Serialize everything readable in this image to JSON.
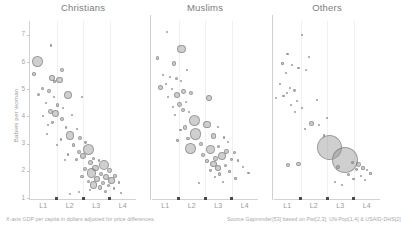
{
  "chart_data": {
    "type": "scatter",
    "title": "",
    "xlabel": "X-axis GDP per capita in dollars adjusted for price differences.",
    "ylabel": "Babies per woman",
    "ylim": [
      1,
      7.4
    ],
    "yticks": [
      1,
      2,
      3,
      4,
      5,
      6,
      7
    ],
    "xticks_labels": [
      "L1",
      "L2",
      "L3",
      "L4"
    ],
    "grid": "faint-vertical",
    "legend": "none",
    "source": "Source Gapminder[53] based on Pwt[2,3], UN-Pop[1,4] & USAID-DHS[2]",
    "panels": [
      {
        "name": "Christians",
        "points": [
          {
            "x": 0.07,
            "y": 6.03,
            "r": 5.4
          },
          {
            "x": 0.2,
            "y": 6.6,
            "r": 1.3
          },
          {
            "x": 0.04,
            "y": 5.55,
            "r": 1.8
          },
          {
            "x": 0.3,
            "y": 5.7,
            "r": 2.2
          },
          {
            "x": 0.21,
            "y": 5.42,
            "r": 2.8
          },
          {
            "x": 0.23,
            "y": 5.28,
            "r": 1.2
          },
          {
            "x": 0.28,
            "y": 5.35,
            "r": 3.2
          },
          {
            "x": 0.12,
            "y": 5.02,
            "r": 1.6
          },
          {
            "x": 0.18,
            "y": 4.92,
            "r": 2.0
          },
          {
            "x": 0.08,
            "y": 4.8,
            "r": 1.5
          },
          {
            "x": 0.23,
            "y": 4.72,
            "r": 1.1
          },
          {
            "x": 0.36,
            "y": 4.8,
            "r": 4.0
          },
          {
            "x": 0.49,
            "y": 4.72,
            "r": 1.0
          },
          {
            "x": 0.15,
            "y": 4.5,
            "r": 1.3
          },
          {
            "x": 0.26,
            "y": 4.42,
            "r": 1.6
          },
          {
            "x": 0.31,
            "y": 4.3,
            "r": 1.2
          },
          {
            "x": 0.19,
            "y": 4.18,
            "r": 2.4
          },
          {
            "x": 0.24,
            "y": 4.1,
            "r": 3.6
          },
          {
            "x": 0.12,
            "y": 4.02,
            "r": 1.1
          },
          {
            "x": 0.4,
            "y": 4.05,
            "r": 1.0
          },
          {
            "x": 0.3,
            "y": 3.9,
            "r": 2.2
          },
          {
            "x": 0.21,
            "y": 3.78,
            "r": 1.4
          },
          {
            "x": 0.17,
            "y": 3.7,
            "r": 1.0
          },
          {
            "x": 0.34,
            "y": 3.6,
            "r": 1.2
          },
          {
            "x": 0.44,
            "y": 3.55,
            "r": 1.1
          },
          {
            "x": 0.38,
            "y": 3.3,
            "r": 4.2
          },
          {
            "x": 0.47,
            "y": 3.22,
            "r": 2.0
          },
          {
            "x": 0.29,
            "y": 3.15,
            "r": 1.2
          },
          {
            "x": 0.52,
            "y": 3.05,
            "r": 1.4
          },
          {
            "x": 0.41,
            "y": 2.95,
            "r": 1.6
          },
          {
            "x": 0.46,
            "y": 2.7,
            "r": 2.2
          },
          {
            "x": 0.55,
            "y": 2.78,
            "r": 5.6
          },
          {
            "x": 0.5,
            "y": 2.55,
            "r": 3.0
          },
          {
            "x": 0.36,
            "y": 2.6,
            "r": 1.3
          },
          {
            "x": 0.6,
            "y": 2.45,
            "r": 1.8
          },
          {
            "x": 0.44,
            "y": 2.42,
            "r": 1.5
          },
          {
            "x": 0.57,
            "y": 2.32,
            "r": 2.6
          },
          {
            "x": 0.65,
            "y": 2.38,
            "r": 1.4
          },
          {
            "x": 0.7,
            "y": 2.22,
            "r": 5.2
          },
          {
            "x": 0.62,
            "y": 2.1,
            "r": 3.4
          },
          {
            "x": 0.52,
            "y": 2.05,
            "r": 2.0
          },
          {
            "x": 0.75,
            "y": 2.0,
            "r": 2.4
          },
          {
            "x": 0.58,
            "y": 1.92,
            "r": 4.6
          },
          {
            "x": 0.67,
            "y": 1.88,
            "r": 2.2
          },
          {
            "x": 0.49,
            "y": 1.8,
            "r": 1.6
          },
          {
            "x": 0.72,
            "y": 1.78,
            "r": 3.0
          },
          {
            "x": 0.8,
            "y": 1.82,
            "r": 1.8
          },
          {
            "x": 0.63,
            "y": 1.7,
            "r": 2.8
          },
          {
            "x": 0.77,
            "y": 1.65,
            "r": 3.2
          },
          {
            "x": 0.55,
            "y": 1.62,
            "r": 1.5
          },
          {
            "x": 0.69,
            "y": 1.55,
            "r": 2.0
          },
          {
            "x": 0.84,
            "y": 1.58,
            "r": 1.4
          },
          {
            "x": 0.6,
            "y": 1.48,
            "r": 3.6
          },
          {
            "x": 0.74,
            "y": 1.45,
            "r": 1.7
          },
          {
            "x": 0.66,
            "y": 1.38,
            "r": 2.4
          },
          {
            "x": 0.79,
            "y": 1.35,
            "r": 1.2
          },
          {
            "x": 0.57,
            "y": 1.3,
            "r": 1.0
          },
          {
            "x": 0.71,
            "y": 1.25,
            "r": 1.5
          },
          {
            "x": 0.46,
            "y": 1.22,
            "r": 0.9
          },
          {
            "x": 0.38,
            "y": 1.15,
            "r": 0.8
          },
          {
            "x": 0.86,
            "y": 1.2,
            "r": 1.0
          },
          {
            "x": 0.25,
            "y": 2.95,
            "r": 0.9
          },
          {
            "x": 0.33,
            "y": 2.4,
            "r": 0.9
          },
          {
            "x": 0.16,
            "y": 3.35,
            "r": 0.9
          }
        ]
      },
      {
        "name": "Muslims",
        "points": [
          {
            "x": 0.14,
            "y": 7.1,
            "r": 1.2
          },
          {
            "x": 0.28,
            "y": 6.48,
            "r": 4.4
          },
          {
            "x": 0.05,
            "y": 6.15,
            "r": 1.6
          },
          {
            "x": 0.21,
            "y": 5.95,
            "r": 2.2
          },
          {
            "x": 0.33,
            "y": 5.7,
            "r": 1.0
          },
          {
            "x": 0.1,
            "y": 5.52,
            "r": 1.1
          },
          {
            "x": 0.17,
            "y": 5.45,
            "r": 1.4
          },
          {
            "x": 0.23,
            "y": 5.4,
            "r": 1.5
          },
          {
            "x": 0.27,
            "y": 5.3,
            "r": 1.0
          },
          {
            "x": 0.13,
            "y": 5.2,
            "r": 1.0
          },
          {
            "x": 0.08,
            "y": 5.05,
            "r": 2.6
          },
          {
            "x": 0.19,
            "y": 5.0,
            "r": 1.2
          },
          {
            "x": 0.3,
            "y": 4.92,
            "r": 2.4
          },
          {
            "x": 0.37,
            "y": 4.88,
            "r": 2.0
          },
          {
            "x": 0.24,
            "y": 4.78,
            "r": 3.0
          },
          {
            "x": 0.15,
            "y": 4.7,
            "r": 1.1
          },
          {
            "x": 0.54,
            "y": 4.68,
            "r": 3.0
          },
          {
            "x": 0.32,
            "y": 4.52,
            "r": 1.0
          },
          {
            "x": 0.26,
            "y": 4.45,
            "r": 2.4
          },
          {
            "x": 0.2,
            "y": 4.35,
            "r": 1.2
          },
          {
            "x": 0.29,
            "y": 4.25,
            "r": 2.0
          },
          {
            "x": 0.35,
            "y": 4.15,
            "r": 1.0
          },
          {
            "x": 0.22,
            "y": 4.05,
            "r": 1.1
          },
          {
            "x": 0.4,
            "y": 3.85,
            "r": 5.6
          },
          {
            "x": 0.52,
            "y": 3.7,
            "r": 3.8
          },
          {
            "x": 0.31,
            "y": 3.6,
            "r": 2.2
          },
          {
            "x": 0.62,
            "y": 3.62,
            "r": 1.2
          },
          {
            "x": 0.27,
            "y": 3.5,
            "r": 1.4
          },
          {
            "x": 0.41,
            "y": 3.35,
            "r": 5.8
          },
          {
            "x": 0.58,
            "y": 3.28,
            "r": 2.6
          },
          {
            "x": 0.68,
            "y": 3.22,
            "r": 1.4
          },
          {
            "x": 0.34,
            "y": 3.2,
            "r": 1.6
          },
          {
            "x": 0.24,
            "y": 3.12,
            "r": 1.2
          },
          {
            "x": 0.72,
            "y": 3.05,
            "r": 1.0
          },
          {
            "x": 0.46,
            "y": 2.98,
            "r": 2.0
          },
          {
            "x": 0.63,
            "y": 2.9,
            "r": 1.5
          },
          {
            "x": 0.36,
            "y": 2.82,
            "r": 5.4
          },
          {
            "x": 0.55,
            "y": 2.78,
            "r": 4.6
          },
          {
            "x": 0.7,
            "y": 2.72,
            "r": 2.4
          },
          {
            "x": 0.78,
            "y": 2.68,
            "r": 1.6
          },
          {
            "x": 0.48,
            "y": 2.6,
            "r": 2.0
          },
          {
            "x": 0.66,
            "y": 2.55,
            "r": 4.2
          },
          {
            "x": 0.6,
            "y": 2.45,
            "r": 2.2
          },
          {
            "x": 0.75,
            "y": 2.42,
            "r": 1.4
          },
          {
            "x": 0.52,
            "y": 2.35,
            "r": 1.8
          },
          {
            "x": 0.81,
            "y": 2.38,
            "r": 1.2
          },
          {
            "x": 0.58,
            "y": 2.25,
            "r": 3.4
          },
          {
            "x": 0.69,
            "y": 2.2,
            "r": 1.6
          },
          {
            "x": 0.62,
            "y": 2.1,
            "r": 2.8
          },
          {
            "x": 0.86,
            "y": 2.15,
            "r": 1.0
          },
          {
            "x": 0.55,
            "y": 2.02,
            "r": 1.4
          },
          {
            "x": 0.73,
            "y": 1.98,
            "r": 1.2
          },
          {
            "x": 0.64,
            "y": 1.88,
            "r": 1.6
          },
          {
            "x": 0.91,
            "y": 1.92,
            "r": 1.1
          },
          {
            "x": 0.59,
            "y": 1.78,
            "r": 1.0
          },
          {
            "x": 0.79,
            "y": 1.72,
            "r": 1.3
          },
          {
            "x": 0.67,
            "y": 1.6,
            "r": 1.0
          },
          {
            "x": 0.44,
            "y": 1.55,
            "r": 0.9
          }
        ]
      },
      {
        "name": "Others",
        "points": [
          {
            "x": 0.26,
            "y": 7.0,
            "r": 1.0
          },
          {
            "x": 0.13,
            "y": 6.3,
            "r": 1.4
          },
          {
            "x": 0.33,
            "y": 6.2,
            "r": 1.1
          },
          {
            "x": 0.08,
            "y": 5.95,
            "r": 1.2
          },
          {
            "x": 0.17,
            "y": 5.88,
            "r": 1.0
          },
          {
            "x": 0.23,
            "y": 5.78,
            "r": 1.3
          },
          {
            "x": 0.3,
            "y": 5.7,
            "r": 1.0
          },
          {
            "x": 0.11,
            "y": 5.6,
            "r": 1.1
          },
          {
            "x": 0.06,
            "y": 5.18,
            "r": 1.0
          },
          {
            "x": 0.15,
            "y": 5.05,
            "r": 1.2
          },
          {
            "x": 0.19,
            "y": 4.95,
            "r": 1.4
          },
          {
            "x": 0.12,
            "y": 4.85,
            "r": 1.0
          },
          {
            "x": 0.09,
            "y": 4.75,
            "r": 1.1
          },
          {
            "x": 0.02,
            "y": 4.7,
            "r": 0.9
          },
          {
            "x": 0.22,
            "y": 4.55,
            "r": 1.0
          },
          {
            "x": 0.16,
            "y": 4.42,
            "r": 1.2
          },
          {
            "x": 0.26,
            "y": 4.3,
            "r": 1.0
          },
          {
            "x": 0.2,
            "y": 4.18,
            "r": 0.9
          },
          {
            "x": 0.35,
            "y": 3.75,
            "r": 2.6
          },
          {
            "x": 0.42,
            "y": 3.7,
            "r": 1.0
          },
          {
            "x": 0.29,
            "y": 3.55,
            "r": 0.9
          },
          {
            "x": 0.47,
            "y": 3.3,
            "r": 1.1
          },
          {
            "x": 0.52,
            "y": 2.85,
            "r": 12.5
          },
          {
            "x": 0.67,
            "y": 2.38,
            "r": 13.0
          },
          {
            "x": 0.6,
            "y": 2.15,
            "r": 2.0
          },
          {
            "x": 0.74,
            "y": 2.3,
            "r": 1.8
          },
          {
            "x": 0.8,
            "y": 2.22,
            "r": 2.4
          },
          {
            "x": 0.13,
            "y": 2.2,
            "r": 2.0
          },
          {
            "x": 0.23,
            "y": 2.25,
            "r": 2.2
          },
          {
            "x": 0.78,
            "y": 2.05,
            "r": 1.4
          },
          {
            "x": 0.84,
            "y": 2.1,
            "r": 1.6
          },
          {
            "x": 0.88,
            "y": 2.02,
            "r": 1.2
          },
          {
            "x": 0.7,
            "y": 1.85,
            "r": 1.5
          },
          {
            "x": 0.82,
            "y": 1.8,
            "r": 1.0
          },
          {
            "x": 0.91,
            "y": 1.9,
            "r": 1.1
          },
          {
            "x": 0.75,
            "y": 1.7,
            "r": 1.2
          },
          {
            "x": 0.86,
            "y": 1.65,
            "r": 0.9
          },
          {
            "x": 0.58,
            "y": 1.6,
            "r": 1.0
          },
          {
            "x": 0.64,
            "y": 1.5,
            "r": 0.9
          },
          {
            "x": 0.5,
            "y": 3.95,
            "r": 0.8
          },
          {
            "x": 0.4,
            "y": 4.6,
            "r": 0.8
          }
        ]
      }
    ]
  }
}
